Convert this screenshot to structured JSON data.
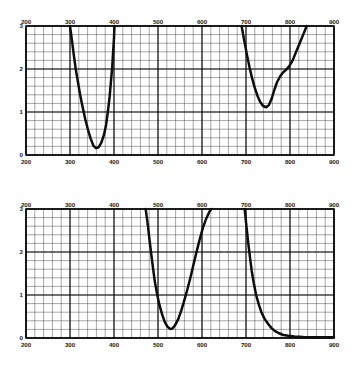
{
  "figure": {
    "background_color": "#ffffff",
    "ink_color": "#0d0d0d",
    "grid_color": "#3b3b3b",
    "panel_count": 2
  },
  "chart_data": [
    {
      "id": "top-panel",
      "type": "line",
      "title": "",
      "xlabel": "",
      "ylabel": "",
      "xlim": [
        200,
        900
      ],
      "ylim": [
        0,
        3
      ],
      "xticks": [
        200,
        300,
        400,
        500,
        600,
        700,
        800,
        900
      ],
      "xtick_labels": [
        "200",
        "300",
        "400",
        "500",
        "600",
        "700",
        "800",
        "900"
      ],
      "yticks": [
        0,
        1,
        2,
        3
      ],
      "ytick_labels": [
        "0",
        "1",
        "2",
        "3"
      ],
      "x_minor_step": 20,
      "y_minor_step": 0.2,
      "grid": true,
      "axis_labels_top": true,
      "axis_labels_bottom": true,
      "legend": "none",
      "series": [
        {
          "name": "band-1",
          "points": [
            [
              300,
              3.0
            ],
            [
              305,
              2.62
            ],
            [
              309,
              2.3
            ],
            [
              313,
              2.0
            ],
            [
              318,
              1.7
            ],
            [
              323,
              1.4
            ],
            [
              329,
              1.1
            ],
            [
              335,
              0.82
            ],
            [
              341,
              0.58
            ],
            [
              347,
              0.38
            ],
            [
              353,
              0.22
            ],
            [
              359,
              0.16
            ],
            [
              365,
              0.18
            ],
            [
              371,
              0.28
            ],
            [
              377,
              0.46
            ],
            [
              382,
              0.7
            ],
            [
              386,
              1.0
            ],
            [
              390,
              1.35
            ],
            [
              393,
              1.7
            ],
            [
              396,
              2.05
            ],
            [
              398,
              2.4
            ],
            [
              400,
              2.72
            ],
            [
              401,
              3.0
            ]
          ]
        },
        {
          "name": "band-2",
          "points": [
            [
              690,
              3.0
            ],
            [
              696,
              2.66
            ],
            [
              702,
              2.34
            ],
            [
              708,
              2.04
            ],
            [
              714,
              1.78
            ],
            [
              720,
              1.56
            ],
            [
              726,
              1.38
            ],
            [
              732,
              1.24
            ],
            [
              739,
              1.14
            ],
            [
              746,
              1.11
            ],
            [
              752,
              1.16
            ],
            [
              758,
              1.3
            ],
            [
              764,
              1.5
            ],
            [
              770,
              1.68
            ],
            [
              777,
              1.82
            ],
            [
              784,
              1.92
            ],
            [
              791,
              1.98
            ],
            [
              798,
              2.06
            ],
            [
              806,
              2.2
            ],
            [
              814,
              2.4
            ],
            [
              822,
              2.6
            ],
            [
              830,
              2.8
            ],
            [
              838,
              3.0
            ]
          ]
        }
      ]
    },
    {
      "id": "bottom-panel",
      "type": "line",
      "title": "",
      "xlabel": "",
      "ylabel": "",
      "xlim": [
        200,
        900
      ],
      "ylim": [
        0,
        3
      ],
      "xticks": [
        200,
        300,
        400,
        500,
        600,
        700,
        800,
        900
      ],
      "xtick_labels": [
        "200",
        "300",
        "400",
        "500",
        "600",
        "700",
        "800",
        "900"
      ],
      "yticks": [
        0,
        1,
        2,
        3
      ],
      "ytick_labels": [
        "0",
        "1",
        "2",
        "3"
      ],
      "x_minor_step": 20,
      "y_minor_step": 0.2,
      "grid": true,
      "axis_labels_top": true,
      "axis_labels_bottom": true,
      "legend": "none",
      "series": [
        {
          "name": "band-1",
          "points": [
            [
              472,
              3.0
            ],
            [
              477,
              2.62
            ],
            [
              481,
              2.26
            ],
            [
              485,
              1.92
            ],
            [
              489,
              1.6
            ],
            [
              493,
              1.3
            ],
            [
              498,
              1.02
            ],
            [
              503,
              0.78
            ],
            [
              509,
              0.56
            ],
            [
              515,
              0.38
            ],
            [
              521,
              0.27
            ],
            [
              527,
              0.21
            ],
            [
              533,
              0.22
            ],
            [
              539,
              0.3
            ],
            [
              546,
              0.44
            ],
            [
              553,
              0.64
            ],
            [
              560,
              0.88
            ],
            [
              567,
              1.14
            ],
            [
              574,
              1.42
            ],
            [
              581,
              1.72
            ],
            [
              588,
              2.02
            ],
            [
              595,
              2.3
            ],
            [
              602,
              2.56
            ],
            [
              609,
              2.76
            ],
            [
              616,
              2.92
            ],
            [
              621,
              3.0
            ]
          ]
        },
        {
          "name": "band-2",
          "points": [
            [
              697,
              3.0
            ],
            [
              701,
              2.6
            ],
            [
              705,
              2.22
            ],
            [
              709,
              1.88
            ],
            [
              713,
              1.56
            ],
            [
              718,
              1.26
            ],
            [
              723,
              1.0
            ],
            [
              729,
              0.78
            ],
            [
              735,
              0.6
            ],
            [
              742,
              0.45
            ],
            [
              750,
              0.33
            ],
            [
              758,
              0.23
            ],
            [
              766,
              0.16
            ],
            [
              775,
              0.11
            ],
            [
              785,
              0.07
            ],
            [
              796,
              0.05
            ],
            [
              810,
              0.035
            ],
            [
              830,
              0.025
            ],
            [
              855,
              0.02
            ],
            [
              880,
              0.015
            ],
            [
              900,
              0.015
            ]
          ]
        }
      ]
    }
  ]
}
